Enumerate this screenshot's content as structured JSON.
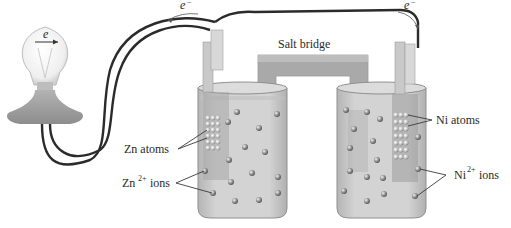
{
  "diagram": {
    "type": "voltaic-cell",
    "labels": {
      "salt_bridge": "Salt bridge",
      "zn_atoms": "Zn atoms",
      "zn_ions_base": "Zn",
      "zn_ions_sup": "2+",
      "zn_ions_suffix": " ions",
      "ni_atoms": "Ni atoms",
      "ni_ions_base": "Ni",
      "ni_ions_sup": "2+",
      "ni_ions_suffix": " ions",
      "electron_bulb": "e",
      "electron_left": "e",
      "electron_right": "e",
      "electron_sup": "−"
    },
    "components": [
      "light-bulb",
      "wire",
      "zinc-electrode",
      "nickel-electrode",
      "salt-bridge",
      "left-beaker",
      "right-beaker"
    ],
    "colors": {
      "wire": "#2b2b2b",
      "solution": "#c9c9c9",
      "electrode": "#b8b8b8",
      "salt_bridge": "#a9a9a9",
      "ion": "#8a8a8a",
      "bulb_base": "#9a9a9a"
    }
  }
}
